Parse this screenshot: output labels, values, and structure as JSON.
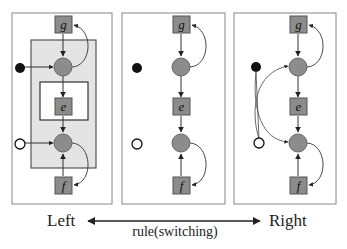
{
  "colors": {
    "node_fill": "#8c8c8c",
    "node_stroke": "#555555",
    "frame_stroke": "#888888",
    "shade_fill": "#e2e2e2",
    "edge": "#333333",
    "filled_dot": "#111111",
    "open_dot": "#ffffff"
  },
  "panels": [
    {
      "id": "left",
      "nodes": {
        "top": "g",
        "middle": "e",
        "bottom": "f"
      },
      "has_outer_plate": true,
      "has_inner_plate": true,
      "dots_connected": "each-to-own-circle"
    },
    {
      "id": "middle",
      "nodes": {
        "top": "g",
        "middle": "e",
        "bottom": "f"
      },
      "has_outer_plate": false,
      "has_inner_plate": false,
      "dots_connected": "none"
    },
    {
      "id": "right",
      "nodes": {
        "top": "g",
        "middle": "e",
        "bottom": "f"
      },
      "has_outer_plate": false,
      "has_inner_plate": false,
      "dots_connected": "crossed"
    }
  ],
  "footer": {
    "left_label": "Left",
    "right_label": "Right",
    "arrow_label": "rule(switching)"
  }
}
